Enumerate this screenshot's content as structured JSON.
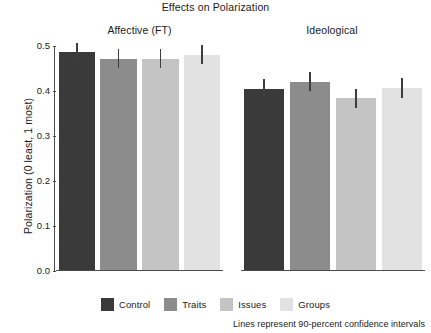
{
  "chart_data": {
    "type": "bar",
    "title": "Effects on Polarization",
    "xlabel": "",
    "ylabel": "Polarization (0 least, 1 most)",
    "ylim": [
      0.0,
      0.5
    ],
    "ytick_labels": [
      "0.0",
      "0.1",
      "0.2",
      "0.3",
      "0.4",
      "0.5"
    ],
    "ytick_values": [
      0.0,
      0.1,
      0.2,
      0.3,
      0.4,
      0.5
    ],
    "grid": false,
    "legend_position": "bottom-center",
    "categories": [
      "Control",
      "Traits",
      "Issues",
      "Groups"
    ],
    "panels": [
      {
        "label": "Affective (FT)",
        "values": [
          0.485,
          0.47,
          0.47,
          0.478
        ],
        "ci_low": [
          0.465,
          0.45,
          0.45,
          0.457
        ],
        "ci_high": [
          0.505,
          0.491,
          0.491,
          0.499
        ]
      },
      {
        "label": "Ideological",
        "values": [
          0.403,
          0.418,
          0.382,
          0.404
        ],
        "ci_low": [
          0.383,
          0.397,
          0.361,
          0.383
        ],
        "ci_high": [
          0.424,
          0.44,
          0.403,
          0.426
        ]
      }
    ],
    "series_colors": [
      "#3a3a3a",
      "#8c8c8c",
      "#c4c4c4",
      "#e2e2e2"
    ],
    "errorbar_color": "#3d3d3d",
    "axis_color": "#4d4d4d",
    "annotation": "Lines represent 90-percent confidence intervals"
  },
  "legend": {
    "items": [
      {
        "label": "Control",
        "color": "#3a3a3a"
      },
      {
        "label": "Traits",
        "color": "#8c8c8c"
      },
      {
        "label": "Issues",
        "color": "#c4c4c4"
      },
      {
        "label": "Groups",
        "color": "#e2e2e2"
      }
    ]
  }
}
